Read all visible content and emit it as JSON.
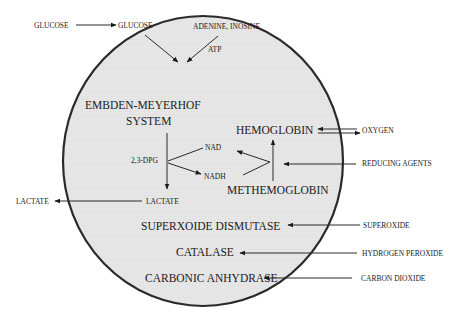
{
  "diagram": {
    "type": "red-blood-cell-metabolism",
    "colors": {
      "cell_fill": "#e8e8e8",
      "cell_stroke": "#2a2a2a",
      "text": "#1a1a1a",
      "background": "#ffffff"
    },
    "inside": {
      "glucose": "GLUCOSE",
      "adenine_inosine": "ADENINE, INOSINE",
      "atp": "ATP",
      "embden_line1": "EMBDEN-MEYERHOF",
      "embden_line2": "SYSTEM",
      "dpg": "2,3-DPG",
      "nad": "NAD",
      "nadh": "NADH",
      "lactate": "LACTATE",
      "hemoglobin": "HEMOGLOBIN",
      "methemoglobin": "METHEMOGLOBIN",
      "superoxide_dismutase": "SUPERXOIDE DISMUTASE",
      "catalase": "CATALASE",
      "carbonic_anhydrase": "CARBONIC ANHYDRASE"
    },
    "outside": {
      "glucose": "GLUCOSE",
      "lactate": "LACTATE",
      "oxygen": "OXYGEN",
      "reducing_agents": "REDUCING AGENTS",
      "superoxide": "SUPEROXIDE",
      "hydrogen_peroxide": "HYDROGEN PEROXIDE",
      "carbon_dioxide": "CARBON DIOXIDE"
    }
  }
}
